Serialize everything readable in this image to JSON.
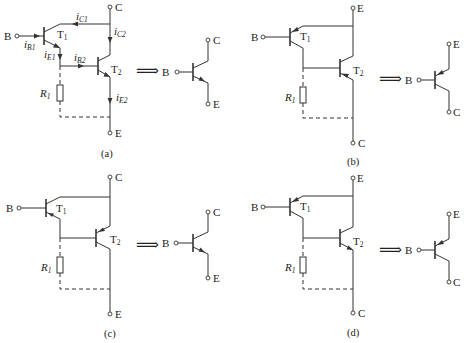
{
  "figure": {
    "equiv_arrow": "⟹",
    "panels": [
      {
        "id": "a",
        "caption": "(a)",
        "type": "NPN + NPN -> NPN",
        "terminals": {
          "base": "B",
          "top": "C",
          "bottom": "E"
        },
        "transistors": [
          {
            "label": "T",
            "sub": "1"
          },
          {
            "label": "T",
            "sub": "2"
          }
        ],
        "resistor": {
          "label": "R",
          "sub": "1"
        },
        "currents": [
          {
            "label": "i",
            "sub": "B1"
          },
          {
            "label": "i",
            "sub": "C1"
          },
          {
            "label": "i",
            "sub": "C2"
          },
          {
            "label": "i",
            "sub": "E1"
          },
          {
            "label": "i",
            "sub": "B2"
          },
          {
            "label": "i",
            "sub": "E2"
          }
        ],
        "equivalent": {
          "type": "NPN",
          "base": "B",
          "top": "C",
          "bottom": "E"
        }
      },
      {
        "id": "b",
        "caption": "(b)",
        "type": "PNP + PNP -> PNP",
        "terminals": {
          "base": "B",
          "top": "E",
          "bottom": "C"
        },
        "transistors": [
          {
            "label": "T",
            "sub": "1"
          },
          {
            "label": "T",
            "sub": "2"
          }
        ],
        "resistor": {
          "label": "R",
          "sub": "1"
        },
        "equivalent": {
          "type": "PNP",
          "base": "B",
          "top": "E",
          "bottom": "C"
        }
      },
      {
        "id": "c",
        "caption": "(c)",
        "type": "NPN + PNP -> NPN",
        "terminals": {
          "base": "B",
          "top": "C",
          "bottom": "E"
        },
        "transistors": [
          {
            "label": "T",
            "sub": "1"
          },
          {
            "label": "T",
            "sub": "2"
          }
        ],
        "resistor": {
          "label": "R",
          "sub": "1"
        },
        "equivalent": {
          "type": "NPN",
          "base": "B",
          "top": "C",
          "bottom": "E"
        }
      },
      {
        "id": "d",
        "caption": "(d)",
        "type": "PNP + NPN -> PNP",
        "terminals": {
          "base": "B",
          "top": "E",
          "bottom": "C"
        },
        "transistors": [
          {
            "label": "T",
            "sub": "1"
          },
          {
            "label": "T",
            "sub": "2"
          }
        ],
        "resistor": {
          "label": "R",
          "sub": "1"
        },
        "equivalent": {
          "type": "PNP",
          "base": "B",
          "top": "E",
          "bottom": "C"
        }
      }
    ]
  }
}
